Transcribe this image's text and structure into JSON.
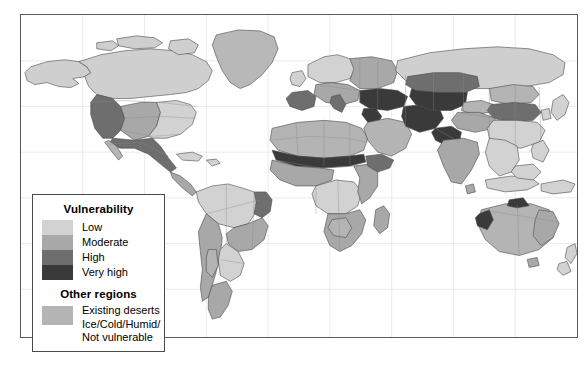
{
  "figure": {
    "name": "world-desertification-vulnerability-map",
    "background_color": "#ffffff",
    "frame_color": "#5a5a5a"
  },
  "legend": {
    "title": "Vulnerability",
    "second_title": "Other regions",
    "items": [
      {
        "label": "Low",
        "color": "#d2d2d2"
      },
      {
        "label": "Moderate",
        "color": "#a8a8a8"
      },
      {
        "label": "High",
        "color": "#6e6e6e"
      },
      {
        "label": "Very high",
        "color": "#3a3a3a"
      }
    ],
    "other": {
      "color": "#b4b4b4",
      "lines": [
        "Existing deserts",
        "Ice/Cold/Humid/",
        "Not vulnerable"
      ]
    }
  },
  "map": {
    "ocean_color": "#ffffff",
    "graticule_color": "#c9c9c9",
    "coast_color": "#4a4a4a",
    "border_color": "#808080",
    "palette": {
      "low": "#d2d2d2",
      "moderate": "#a8a8a8",
      "high": "#6e6e6e",
      "very_high": "#3a3a3a",
      "desert": "#b4b4b4",
      "not_vulnerable": "#cfcfcf"
    },
    "regions": [
      {
        "name": "alaska",
        "class": "not_vulnerable"
      },
      {
        "name": "canada",
        "class": "not_vulnerable"
      },
      {
        "name": "greenland",
        "class": "not_vulnerable"
      },
      {
        "name": "western-usa",
        "class": "high"
      },
      {
        "name": "great-plains-usa",
        "class": "moderate"
      },
      {
        "name": "eastern-usa",
        "class": "low"
      },
      {
        "name": "mexico",
        "class": "high"
      },
      {
        "name": "central-america",
        "class": "moderate"
      },
      {
        "name": "caribbean",
        "class": "low"
      },
      {
        "name": "amazon-basin",
        "class": "low"
      },
      {
        "name": "northeast-brazil",
        "class": "high"
      },
      {
        "name": "cerrado-brazil",
        "class": "moderate"
      },
      {
        "name": "andes",
        "class": "moderate"
      },
      {
        "name": "atacama-desert",
        "class": "desert"
      },
      {
        "name": "pampas",
        "class": "low"
      },
      {
        "name": "patagonia",
        "class": "moderate"
      },
      {
        "name": "sahara-desert",
        "class": "desert"
      },
      {
        "name": "sahel",
        "class": "very_high"
      },
      {
        "name": "west-africa",
        "class": "moderate"
      },
      {
        "name": "congo-basin",
        "class": "low"
      },
      {
        "name": "east-africa",
        "class": "moderate"
      },
      {
        "name": "horn-of-africa",
        "class": "high"
      },
      {
        "name": "southern-africa",
        "class": "moderate"
      },
      {
        "name": "kalahari-desert",
        "class": "desert"
      },
      {
        "name": "madagascar",
        "class": "moderate"
      },
      {
        "name": "iberia",
        "class": "high"
      },
      {
        "name": "mediterranean-europe",
        "class": "moderate"
      },
      {
        "name": "northern-europe",
        "class": "low"
      },
      {
        "name": "eastern-europe",
        "class": "moderate"
      },
      {
        "name": "turkey-caucasus",
        "class": "very_high"
      },
      {
        "name": "arabian-desert",
        "class": "desert"
      },
      {
        "name": "levant",
        "class": "very_high"
      },
      {
        "name": "iran-plateau",
        "class": "very_high"
      },
      {
        "name": "central-asia",
        "class": "very_high"
      },
      {
        "name": "kazakh-steppe",
        "class": "high"
      },
      {
        "name": "siberia",
        "class": "not_vulnerable"
      },
      {
        "name": "mongolia-gobi",
        "class": "desert"
      },
      {
        "name": "northern-china",
        "class": "high"
      },
      {
        "name": "southern-china",
        "class": "low"
      },
      {
        "name": "taklamakan-desert",
        "class": "desert"
      },
      {
        "name": "tibetan-plateau",
        "class": "moderate"
      },
      {
        "name": "pakistan-thar",
        "class": "very_high"
      },
      {
        "name": "india",
        "class": "moderate"
      },
      {
        "name": "southeast-asia",
        "class": "low"
      },
      {
        "name": "indonesia",
        "class": "low"
      },
      {
        "name": "new-guinea",
        "class": "low"
      },
      {
        "name": "australia-interior",
        "class": "desert"
      },
      {
        "name": "australia-west",
        "class": "very_high"
      },
      {
        "name": "australia-east",
        "class": "moderate"
      },
      {
        "name": "new-zealand",
        "class": "low"
      },
      {
        "name": "japan",
        "class": "low"
      }
    ]
  }
}
